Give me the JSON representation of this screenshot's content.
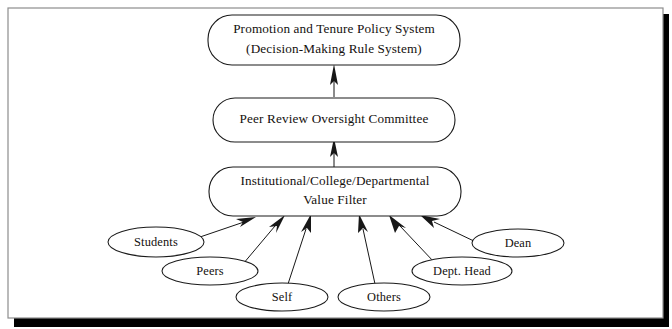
{
  "diagram": {
    "frame": {
      "border_color": "#8d8d8d",
      "shadow_color": "#000000",
      "background_color": "#ffffff"
    },
    "stroke_color": "#1a1a1a",
    "text_color": "#14100e",
    "boxes": [
      {
        "id": "policy-system",
        "shape": "rounded-rectangle",
        "lines": [
          "Promotion and Tenure Policy System",
          "(Decision-Making Rule System)"
        ]
      },
      {
        "id": "oversight-committee",
        "shape": "rounded-rectangle",
        "lines": [
          "Peer Review Oversight Committee"
        ]
      },
      {
        "id": "value-filter",
        "shape": "rounded-rectangle",
        "lines": [
          "Institutional/College/Departmental",
          "Value Filter"
        ]
      }
    ],
    "sources": [
      {
        "id": "students",
        "label": "Students"
      },
      {
        "id": "peers",
        "label": "Peers"
      },
      {
        "id": "self",
        "label": "Self"
      },
      {
        "id": "others",
        "label": "Others"
      },
      {
        "id": "dept-head",
        "label": "Dept. Head"
      },
      {
        "id": "dean",
        "label": "Dean"
      }
    ],
    "connectors": [
      {
        "from": "value-filter",
        "to": "oversight-committee",
        "style": "arrow-up"
      },
      {
        "from": "oversight-committee",
        "to": "policy-system",
        "style": "arrow-up"
      },
      {
        "from": "students",
        "to": "value-filter",
        "style": "arrow"
      },
      {
        "from": "peers",
        "to": "value-filter",
        "style": "arrow"
      },
      {
        "from": "self",
        "to": "value-filter",
        "style": "arrow"
      },
      {
        "from": "others",
        "to": "value-filter",
        "style": "arrow"
      },
      {
        "from": "dept-head",
        "to": "value-filter",
        "style": "arrow"
      },
      {
        "from": "dean",
        "to": "value-filter",
        "style": "arrow"
      }
    ]
  }
}
